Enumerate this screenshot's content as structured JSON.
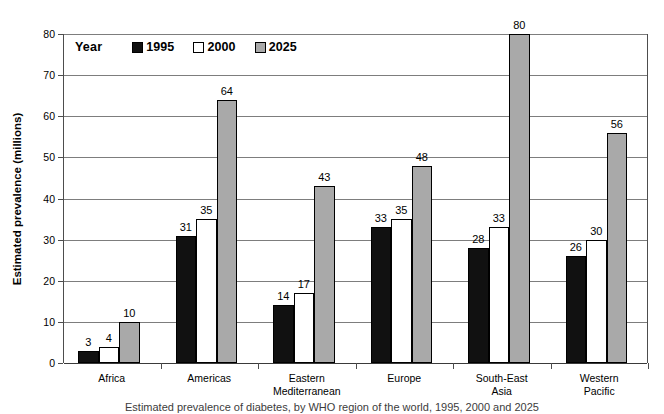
{
  "chart_data": {
    "type": "bar",
    "title": "",
    "subtitle": "",
    "xlabel": "",
    "ylabel": "Estimated prevalence (millions)",
    "ylim": [
      0,
      80
    ],
    "yticks": [
      0,
      10,
      20,
      30,
      40,
      50,
      60,
      70,
      80
    ],
    "ytick_labels": [
      "0",
      "10",
      "20",
      "30",
      "40",
      "50",
      "60",
      "70",
      "80"
    ],
    "grid": true,
    "legend_position": "top-left-inside",
    "legend_title": "Year",
    "categories": [
      "Africa",
      "Americas",
      "Eastern\nMediterranean",
      "Europe",
      "South-East\nAsia",
      "Western\nPacific"
    ],
    "series": [
      {
        "name": "1995",
        "color": "#111111",
        "values": [
          3,
          31,
          14,
          33,
          28,
          26
        ]
      },
      {
        "name": "2000",
        "color": "#ffffff",
        "values": [
          4,
          35,
          17,
          35,
          33,
          30
        ]
      },
      {
        "name": "2025",
        "color": "#a9a9a9",
        "values": [
          10,
          64,
          43,
          48,
          80,
          56
        ]
      }
    ],
    "data_labels": [
      [
        "3",
        "4",
        "10"
      ],
      [
        "31",
        "35",
        "64"
      ],
      [
        "14",
        "17",
        "43"
      ],
      [
        "33",
        "35",
        "48"
      ],
      [
        "28",
        "33",
        "80"
      ],
      [
        "26",
        "30",
        "56"
      ]
    ]
  },
  "axis": {
    "y_title": "Estimated prevalence (millions)"
  },
  "legend": {
    "title": "Year",
    "items": [
      {
        "label": "1995",
        "swatch": "black-square-icon"
      },
      {
        "label": "2000",
        "swatch": "white-square-icon"
      },
      {
        "label": "2025",
        "swatch": "gray-square-icon"
      }
    ]
  },
  "caption": {
    "text": "Estimated prevalence of diabetes, by WHO region of the world, 1995, 2000 and 2025"
  }
}
